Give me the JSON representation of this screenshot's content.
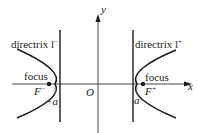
{
  "diagram": {
    "axes": {
      "x_label": "x",
      "y_label": "y",
      "origin_label": "O"
    },
    "left": {
      "directrix_label": "directrix l",
      "directrix_sup": "−",
      "focus_label": "focus",
      "focus_name": "F",
      "focus_sup": "−",
      "vertex_label": "−a"
    },
    "right": {
      "directrix_label": "directrix l",
      "directrix_sup": "+",
      "focus_label": "focus",
      "focus_name": "F",
      "focus_sup": "+",
      "vertex_label": "a"
    },
    "colors": {
      "stroke": "#1a1a1a",
      "text": "#222222",
      "background": "#ffffff"
    }
  }
}
